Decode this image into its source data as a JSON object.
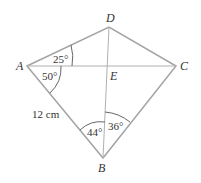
{
  "diagram": {
    "type": "quadrilateral-kite",
    "points": {
      "A": {
        "label": "A",
        "x": 27,
        "y": 66
      },
      "B": {
        "label": "B",
        "x": 103,
        "y": 158
      },
      "C": {
        "label": "C",
        "x": 176,
        "y": 66
      },
      "D": {
        "label": "D",
        "x": 109,
        "y": 27
      },
      "E": {
        "label": "E",
        "x": 108,
        "y": 66
      }
    },
    "angles": {
      "DAE": "25°",
      "EAB": "50°",
      "ABE": "44°",
      "EBC": "36°"
    },
    "lengths": {
      "AB": "12 cm"
    },
    "colors": {
      "stroke": "#a0a0a0",
      "text": "#333333"
    }
  }
}
